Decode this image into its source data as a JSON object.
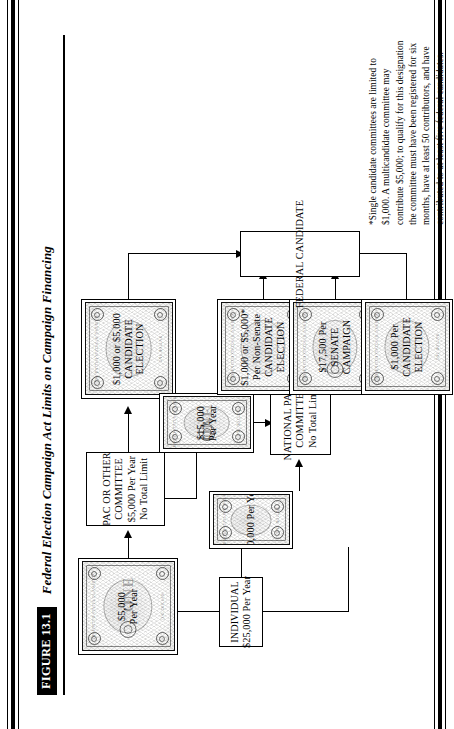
{
  "figure": {
    "label": "FIGURE 13.1",
    "title": "Federal Election Campaign Act Limits on Campaign Financing"
  },
  "nodes": {
    "individual": {
      "name": "INDIVIDUAL",
      "line1": "INDIVIDUAL",
      "line2": "$25,000 Per Year"
    },
    "pac_committee": {
      "line1": "PAC OR OTHER",
      "line2": "COMMITTEE",
      "line3": "$5,000 Per Year",
      "line4": "No Total Limit"
    },
    "national_party": {
      "line1": "NATIONAL PARTY",
      "line2": "COMMITTEE",
      "line3": "No Total Limit"
    },
    "federal_candidate": {
      "line1": "FEDERAL CANDIDATE"
    }
  },
  "bills": {
    "ind_to_pac": {
      "line1": "$5,000",
      "line2": "Per Year"
    },
    "ind_to_party": {
      "line1": "$20,000 Per Year"
    },
    "pac_to_party": {
      "line1": "$15,000",
      "line2": "Per Year"
    },
    "pac_candidate": {
      "line1": "$1,000 or $5,000",
      "line2": "CANDIDATE",
      "line3": "ELECTION"
    },
    "party_non_senate": {
      "line1": "$1,000 or $5,000*",
      "line2": "Per Non-Senate",
      "line3": "CANDIDATE",
      "line4": "ELECTION"
    },
    "party_senate": {
      "line1": "$17,500 Per",
      "line2": "SENATE",
      "line3": "CAMPAIGN"
    },
    "ind_candidate": {
      "line1": "$1,000 Per",
      "line2": "CANDIDATE",
      "line3": "ELECTION"
    }
  },
  "bill_decor": {
    "one": "ONE",
    "micro_top": "THE UNITED STATES OF AMERICA",
    "micro_bottom": "ONE DOLLAR"
  },
  "footnote": {
    "text": "*Single candidate committees are limited to $1,000.  A multicandidate committee may contribute $5,000; to qualify for this designation the committee must have been registered for six months, have at least 50 contributors, and have contributed to at least five federal candidates."
  },
  "colors": {
    "ink": "#000000",
    "paper": "#ffffff"
  }
}
